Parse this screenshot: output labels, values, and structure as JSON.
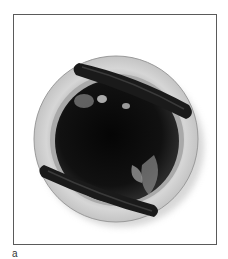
{
  "figure": {
    "panel_label": "a",
    "colors": {
      "frame": "#5a5a5a",
      "sewing_ring": "#c9c9c9",
      "ring_shadow": "#a8a8a8",
      "orifice": "#0a0a0a",
      "struts": "#1c1c1c"
    }
  }
}
